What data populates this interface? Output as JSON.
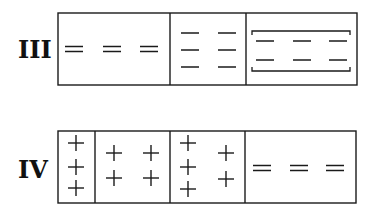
{
  "rows": [
    {
      "label": "III",
      "label_pos": {
        "x": 18,
        "y": 38
      },
      "box": {
        "x": 58,
        "y": 13,
        "w": 299,
        "h": 72
      },
      "dividers": [
        170,
        246
      ],
      "cells": [
        {
          "symbol": "double-dash",
          "items": [
            {
              "x": 74,
              "y": 49
            },
            {
              "x": 112,
              "y": 49
            },
            {
              "x": 149,
              "y": 49
            }
          ]
        },
        {
          "symbol": "single-dash",
          "items": [
            {
              "x": 190,
              "y": 33
            },
            {
              "x": 227,
              "y": 33
            },
            {
              "x": 190,
              "y": 50
            },
            {
              "x": 227,
              "y": 50
            },
            {
              "x": 190,
              "y": 67
            },
            {
              "x": 227,
              "y": 67
            }
          ]
        },
        {
          "symbol": "single-dash",
          "bracket": {
            "x1": 252,
            "y1": 31,
            "x2": 350,
            "y2": 71
          },
          "items": [
            {
              "x": 265,
              "y": 41
            },
            {
              "x": 302,
              "y": 41
            },
            {
              "x": 338,
              "y": 41
            },
            {
              "x": 265,
              "y": 60
            },
            {
              "x": 302,
              "y": 60
            },
            {
              "x": 338,
              "y": 60
            }
          ]
        }
      ]
    },
    {
      "label": "IV",
      "label_pos": {
        "x": 18,
        "y": 158
      },
      "box": {
        "x": 58,
        "y": 131,
        "w": 298,
        "h": 72
      },
      "dividers": [
        95,
        170,
        245
      ],
      "cells": [
        {
          "symbol": "plus",
          "items": [
            {
              "x": 76,
              "y": 143
            },
            {
              "x": 76,
              "y": 167
            },
            {
              "x": 76,
              "y": 188
            }
          ]
        },
        {
          "symbol": "plus",
          "items": [
            {
              "x": 114,
              "y": 153
            },
            {
              "x": 151,
              "y": 153
            },
            {
              "x": 114,
              "y": 178
            },
            {
              "x": 151,
              "y": 178
            }
          ]
        },
        {
          "symbol": "plus",
          "items": [
            {
              "x": 188,
              "y": 143
            },
            {
              "x": 188,
              "y": 167
            },
            {
              "x": 188,
              "y": 189
            },
            {
              "x": 226,
              "y": 153
            },
            {
              "x": 226,
              "y": 179
            }
          ]
        },
        {
          "symbol": "double-dash",
          "items": [
            {
              "x": 262,
              "y": 168
            },
            {
              "x": 299,
              "y": 168
            },
            {
              "x": 335,
              "y": 168
            }
          ]
        }
      ]
    }
  ],
  "style": {
    "stroke": "#1a1a1a"
  }
}
